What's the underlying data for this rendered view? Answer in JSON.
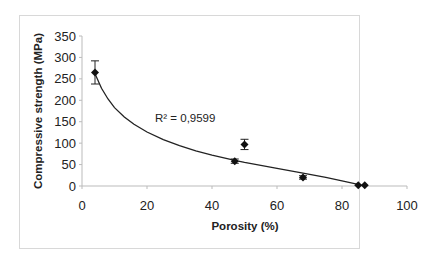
{
  "chart_data": {
    "type": "scatter",
    "title": "",
    "xlabel": "Porosity (%)",
    "ylabel": "Compressive strength (MPa)",
    "xlim": [
      0,
      100
    ],
    "ylim": [
      0,
      350
    ],
    "x_ticks": [
      0,
      20,
      40,
      60,
      80,
      100
    ],
    "y_ticks": [
      0,
      50,
      100,
      150,
      200,
      250,
      300,
      350
    ],
    "grid": false,
    "legend": null,
    "series": [
      {
        "name": "Measured",
        "marker": "diamond",
        "points": [
          {
            "x": 4,
            "y": 265,
            "err": 27
          },
          {
            "x": 47,
            "y": 58,
            "err": 5
          },
          {
            "x": 50,
            "y": 97,
            "err": 12
          },
          {
            "x": 68,
            "y": 20,
            "err": 4
          },
          {
            "x": 85,
            "y": 2,
            "err": 0
          },
          {
            "x": 87,
            "y": 2,
            "err": 0
          }
        ]
      },
      {
        "name": "Logarithmic trendline",
        "type": "line",
        "x": [
          4,
          6,
          8,
          10,
          13,
          16,
          20,
          25,
          30,
          35,
          40,
          47,
          50,
          55,
          60,
          68,
          75,
          80,
          86
        ],
        "y": [
          262,
          228,
          203,
          183,
          161,
          144,
          126,
          108,
          94,
          82,
          72,
          60,
          55,
          48,
          41,
          30,
          20,
          12,
          2
        ]
      }
    ],
    "annotations": [
      {
        "text": "R² = 0,9599",
        "x": 30,
        "y": 130
      }
    ]
  }
}
